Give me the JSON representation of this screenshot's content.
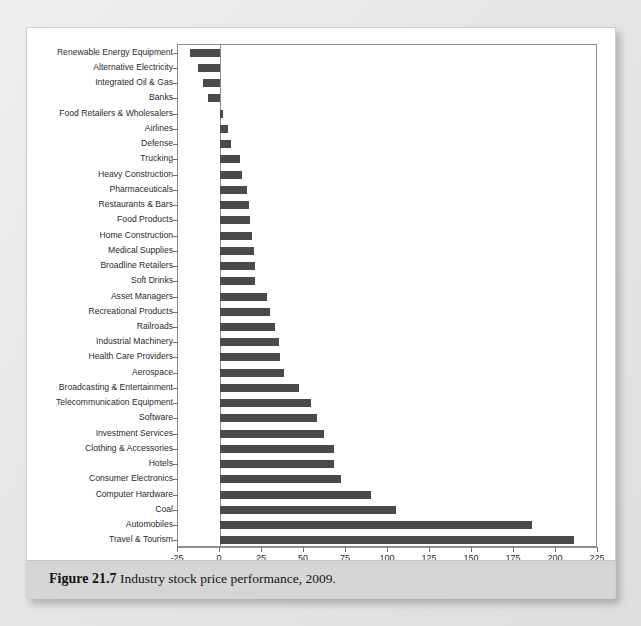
{
  "figure": {
    "number_label": "Figure 21.7",
    "caption_text": "Industry stock price performance, 2009."
  },
  "chart_data": {
    "type": "bar",
    "orientation": "horizontal",
    "title": "",
    "xlabel": "Rate of Return (%)",
    "ylabel": "",
    "xlim": [
      -25,
      225
    ],
    "xticks": [
      -25,
      0,
      25,
      50,
      75,
      100,
      125,
      150,
      175,
      200,
      225
    ],
    "xtick_labels": [
      "-25",
      "0",
      "25",
      "50",
      "75",
      "100",
      "125",
      "150",
      "175",
      "200",
      "225"
    ],
    "grid": false,
    "legend": null,
    "bar_color": "#4a4a4a",
    "categories": [
      "Renewable Energy Equipment",
      "Alternative Electricity",
      "Integrated Oil & Gas",
      "Banks",
      "Food Retailers & Wholesalers",
      "Airlines",
      "Defense",
      "Trucking",
      "Heavy Construction",
      "Pharmaceuticals",
      "Restaurants & Bars",
      "Food Products",
      "Home Construction",
      "Medical Supplies",
      "Broadline Retailers",
      "Soft Drinks",
      "Asset Managers",
      "Recreational Products",
      "Railroads",
      "Industrial Machinery",
      "Health Care Providers",
      "Aerospace",
      "Broadcasting & Entertainment",
      "Telecommunication Equipment",
      "Software",
      "Investment Services",
      "Clothing & Accessories",
      "Hotels",
      "Consumer Electronics",
      "Computer Hardware",
      "Coal",
      "Automobiles",
      "Travel & Tourism"
    ],
    "values": [
      -18,
      -13,
      -10,
      -7,
      1.5,
      4.5,
      6.5,
      12,
      13,
      16,
      17,
      18,
      19,
      20,
      21,
      21,
      28,
      30,
      33,
      35,
      36,
      38,
      47,
      54,
      58,
      62,
      68,
      68,
      72,
      90,
      105,
      186,
      211
    ]
  },
  "bleed_text": [
    "the performance of the market",
    "sectors in relative terms",
    "across the cycle",
    "investors focus on",
    "industry returns",
    "for the period shown"
  ]
}
